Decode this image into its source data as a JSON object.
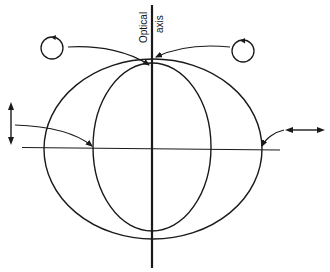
{
  "diagram": {
    "labels": {
      "axis_line1": "Optical",
      "axis_line2": "axis"
    },
    "elements": [
      "optical-axis-line",
      "outer-ellipse",
      "inner-ellipse",
      "horizontal-reference-line",
      "left-circular-polarization-icon",
      "right-circular-polarization-icon",
      "left-vertical-double-arrow",
      "right-horizontal-double-arrow"
    ],
    "colors": {
      "stroke": "#1a1a1a",
      "background": "#ffffff"
    }
  }
}
